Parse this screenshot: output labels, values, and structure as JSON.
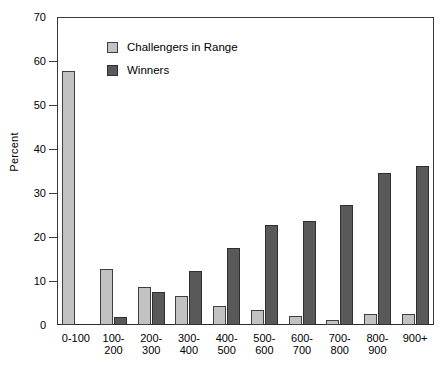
{
  "chart_data": {
    "type": "bar",
    "title": "",
    "subtitle": "",
    "xlabel": "",
    "ylabel": "Percent",
    "ylim": [
      0,
      70
    ],
    "ytick_step": 10,
    "yticks": [
      0,
      10,
      20,
      30,
      40,
      50,
      60,
      70
    ],
    "grid": false,
    "legend_position": "upper-left-inside",
    "categories": [
      "0-100",
      "100-\n200",
      "200-\n300",
      "300-\n400",
      "400-\n500",
      "500-\n600",
      "600-\n700",
      "700-\n800",
      "800-\n900",
      "900+"
    ],
    "series": [
      {
        "name": "Challengers in Range",
        "color": "#c2c2c2",
        "values": [
          57.8,
          12.8,
          8.7,
          6.5,
          4.4,
          3.3,
          2.1,
          1.1,
          2.4,
          2.6
        ]
      },
      {
        "name": "Winners",
        "color": "#595959",
        "values": [
          0,
          1.8,
          7.5,
          12.2,
          17.6,
          22.8,
          23.6,
          27.2,
          34.5,
          36.1
        ]
      }
    ]
  },
  "legend": {
    "items": [
      {
        "label": "Challengers in Range",
        "swatch": "light-gray-swatch"
      },
      {
        "label": "Winners",
        "swatch": "dark-gray-swatch"
      }
    ]
  },
  "axes": {
    "y_title": "Percent",
    "y_tick_labels": [
      "0",
      "10",
      "20",
      "30",
      "40",
      "50",
      "60",
      "70"
    ],
    "x_tick_labels": [
      "0-100",
      "100-\n200",
      "200-\n300",
      "300-\n400",
      "400-\n500",
      "500-\n600",
      "600-\n700",
      "700-\n800",
      "800-\n900",
      "900+"
    ]
  },
  "caption": {
    "partial_text": ""
  },
  "colors": {
    "challengers": "#c2c2c2",
    "winners": "#595959",
    "axis": "#3a3a3a",
    "background": "#ffffff"
  }
}
